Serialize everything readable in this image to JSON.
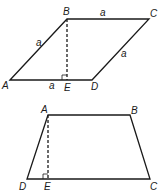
{
  "figures": [
    {
      "name": "rhombus",
      "vertices": {
        "A": "A",
        "B": "B",
        "C": "C",
        "D": "D",
        "E": "E"
      },
      "side_labels": {
        "AB": "a",
        "BC": "a",
        "CD": "a",
        "AE": "a"
      }
    },
    {
      "name": "trapezoid",
      "vertices": {
        "A": "A",
        "B": "B",
        "C": "C",
        "D": "D",
        "E": "E"
      }
    }
  ]
}
